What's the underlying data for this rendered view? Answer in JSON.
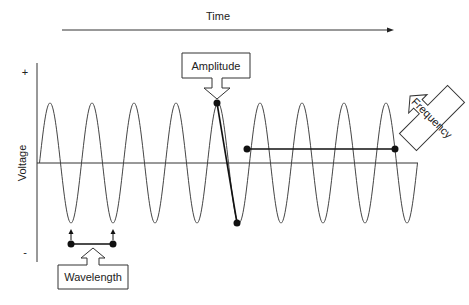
{
  "diagram": {
    "time_label": "Time",
    "voltage_label": "Voltage",
    "plus_label": "+",
    "minus_label": "-",
    "callouts": {
      "amplitude": "Amplitude",
      "frequency": "Frequency",
      "wavelength": "Wavelength"
    },
    "colors": {
      "line": "#222222",
      "wave": "#444444",
      "background": "#ffffff"
    }
  }
}
